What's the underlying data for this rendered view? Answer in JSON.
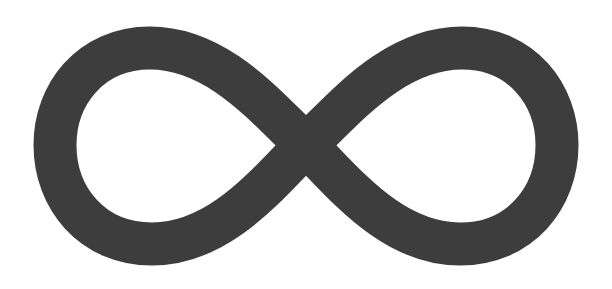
{
  "image": {
    "subject": "infinity-symbol",
    "label": "Infinity symbol",
    "background_color": "#ffffff",
    "symbol_color": "#3d3d3d",
    "stroke_width_px": 43
  }
}
